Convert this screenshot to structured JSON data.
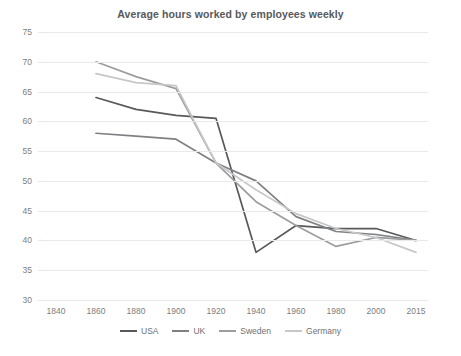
{
  "chart_data": {
    "type": "line",
    "title": "Average hours worked by employees weekly",
    "xlabel": "",
    "ylabel": "",
    "ylim": [
      30,
      75
    ],
    "ystep": 5,
    "yticks": [
      30,
      35,
      40,
      45,
      50,
      55,
      60,
      65,
      70,
      75
    ],
    "xticks": [
      "1840",
      "1860",
      "1880",
      "1900",
      "1920",
      "1940",
      "1960",
      "1980",
      "2000",
      "2015"
    ],
    "grid": true,
    "legend_position": "bottom",
    "series": [
      {
        "name": "USA",
        "color": "#58595b",
        "x": [
          "1860",
          "1880",
          "1900",
          "1920",
          "1940",
          "1960",
          "1980",
          "2000",
          "2015"
        ],
        "values": [
          64,
          62,
          61,
          60.5,
          38,
          42.5,
          42,
          42,
          40
        ]
      },
      {
        "name": "UK",
        "color": "#7f8083",
        "x": [
          "1860",
          "1880",
          "1900",
          "1920",
          "1940",
          "1960",
          "1980",
          "2000",
          "2015"
        ],
        "values": [
          58,
          57.5,
          57,
          53,
          50,
          44,
          41.5,
          41,
          40
        ]
      },
      {
        "name": "Sweden",
        "color": "#9c9d9f",
        "x": [
          "1860",
          "1880",
          "1900",
          "1920",
          "1940",
          "1960",
          "1980",
          "2000",
          "2015"
        ],
        "values": [
          70,
          67.5,
          65.5,
          53,
          46.5,
          42.5,
          39,
          40.5,
          40
        ]
      },
      {
        "name": "Germany",
        "color": "#c6c7c8",
        "x": [
          "1860",
          "1880",
          "1900",
          "1920",
          "1940",
          "1960",
          "1980",
          "2000",
          "2015"
        ],
        "values": [
          68,
          66.5,
          66,
          53,
          48.5,
          44.5,
          42,
          40.5,
          38
        ]
      }
    ]
  },
  "legend": {
    "items": [
      {
        "label": "USA"
      },
      {
        "label": "UK"
      },
      {
        "label": "Sweden"
      },
      {
        "label": "Germany"
      }
    ]
  }
}
